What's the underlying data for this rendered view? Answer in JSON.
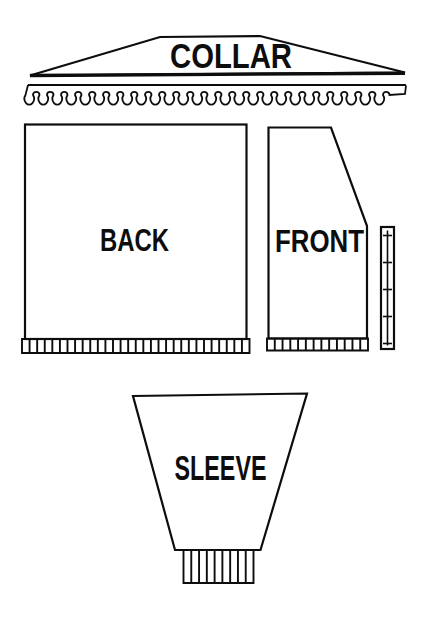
{
  "pieces": {
    "collar": {
      "label": "COLLAR"
    },
    "back": {
      "label": "BACK"
    },
    "front": {
      "label": "FRONT"
    },
    "sleeve": {
      "label": "SLEEVE"
    }
  },
  "colors": {
    "ink": "#0d0d0d",
    "paper": "#ffffff"
  }
}
